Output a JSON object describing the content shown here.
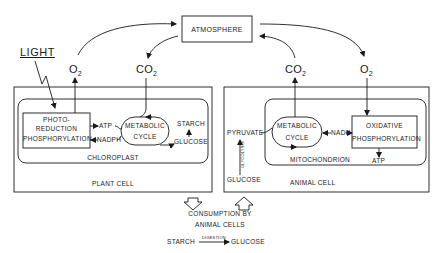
{
  "atmosphere": {
    "label": "ATMOSPHERE"
  },
  "light": {
    "label": "LIGHT"
  },
  "gases": {
    "plant_o2": {
      "base": "O",
      "sub": "2"
    },
    "plant_co2": {
      "base": "CO",
      "sub": "2"
    },
    "animal_co2": {
      "base": "CO",
      "sub": "2"
    },
    "animal_o2": {
      "base": "O",
      "sub": "2"
    }
  },
  "plant_cell": {
    "label": "PLANT CELL",
    "organelle": "CHLOROPLAST",
    "photo_box": [
      "PHOTO-",
      "REDUCTION",
      "PHOSPHORYLATION"
    ],
    "atp": "ATP",
    "nadph": "NADPH",
    "cycle": [
      "METABOLIC",
      "CYCLE"
    ],
    "starch": "STARCH",
    "glucose": "GLUCOSE"
  },
  "animal_cell": {
    "label": "ANIMAL CELL",
    "organelle": "MITOCHONDRION",
    "pyruvate": "PYRUVATE",
    "glycolysis": "GLYCOLYSIS",
    "glucose": "GLUCOSE",
    "cycle": [
      "METABOLIC",
      "CYCLE"
    ],
    "nadh": "NADH",
    "oxidative_box": [
      "OXIDATIVE",
      "PHOSPHORYLATION"
    ],
    "atp": "ATP"
  },
  "consumption": {
    "line1": "CONSUMPTION BY",
    "line2": "ANIMAL CELLS",
    "starch": "STARCH",
    "digestion": "DIGESTION",
    "glucose": "GLUCOSE"
  }
}
